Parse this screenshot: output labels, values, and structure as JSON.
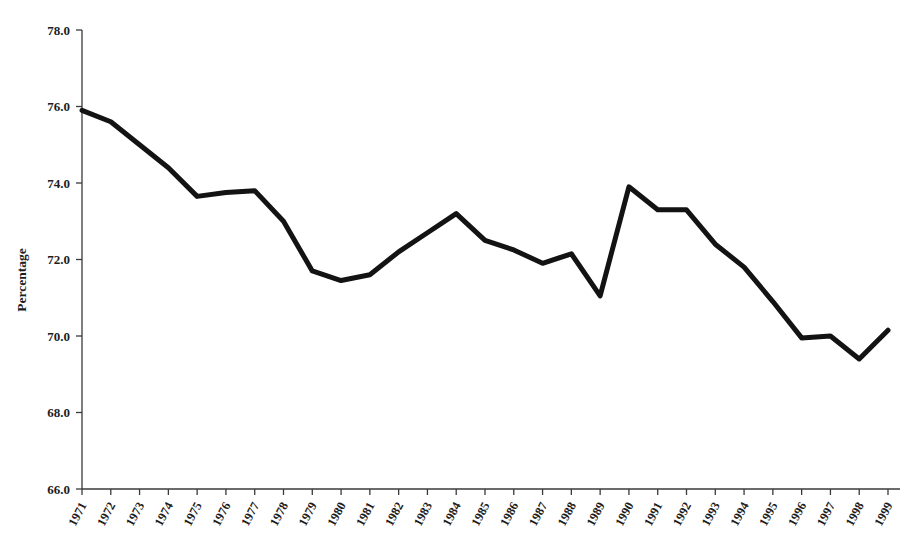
{
  "chart_data": {
    "type": "line",
    "title": "",
    "subtitle": "",
    "xlabel": "",
    "ylabel": "Percentage",
    "grid": false,
    "legend": "none",
    "xlim": [
      1971,
      1999
    ],
    "ylim": [
      66.0,
      78.0
    ],
    "ytick_step": 2.0,
    "ytick_labels": [
      "66.0",
      "68.0",
      "70.0",
      "72.0",
      "74.0",
      "76.0",
      "78.0"
    ],
    "ytick_values": [
      66.0,
      68.0,
      70.0,
      72.0,
      74.0,
      76.0,
      78.0
    ],
    "categories": [
      "1971",
      "1972",
      "1973",
      "1974",
      "1975",
      "1976",
      "1977",
      "1978",
      "1979",
      "1980",
      "1981",
      "1982",
      "1983",
      "1984",
      "1985",
      "1986",
      "1987",
      "1988",
      "1989",
      "1990",
      "1991",
      "1992",
      "1993",
      "1994",
      "1995",
      "1996",
      "1997",
      "1998",
      "1999"
    ],
    "x": [
      1971,
      1972,
      1973,
      1974,
      1975,
      1976,
      1977,
      1978,
      1979,
      1980,
      1981,
      1982,
      1983,
      1984,
      1985,
      1986,
      1987,
      1988,
      1989,
      1990,
      1991,
      1992,
      1993,
      1994,
      1995,
      1996,
      1997,
      1998,
      1999
    ],
    "values": [
      75.9,
      75.6,
      75.0,
      74.4,
      73.65,
      73.75,
      73.8,
      73.0,
      71.7,
      71.45,
      71.6,
      72.2,
      72.7,
      73.2,
      72.5,
      72.25,
      71.9,
      72.15,
      71.05,
      73.9,
      73.3,
      73.3,
      72.4,
      71.8,
      70.9,
      69.95,
      70.0,
      69.4,
      70.15
    ],
    "series": [
      {
        "name": "Percentage",
        "color": "#131313",
        "line_width": 5,
        "values": [
          75.9,
          75.6,
          75.0,
          74.4,
          73.65,
          73.75,
          73.8,
          73.0,
          71.7,
          71.45,
          71.6,
          72.2,
          72.7,
          73.2,
          72.5,
          72.25,
          71.9,
          72.15,
          71.05,
          73.9,
          73.3,
          73.3,
          72.4,
          71.8,
          70.9,
          69.95,
          70.0,
          69.4,
          70.15
        ]
      }
    ],
    "colors": {
      "line": "#131313",
      "axis": "#3a3a3a",
      "text": "#1d1d1d",
      "background": "#ffffff"
    }
  }
}
